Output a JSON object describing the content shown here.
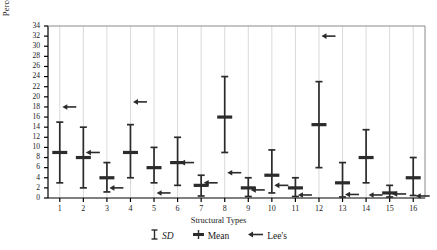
{
  "chart_data": {
    "type": "bar",
    "title": "",
    "xlabel": "Structural Types",
    "ylabel": "Percentage",
    "ylim": [
      0,
      34
    ],
    "ytick_step": 2,
    "yticks": [
      0,
      2,
      4,
      6,
      8,
      10,
      12,
      14,
      16,
      18,
      20,
      22,
      24,
      26,
      28,
      30,
      32,
      34
    ],
    "categories": [
      "1",
      "2",
      "3",
      "4",
      "5",
      "6",
      "7",
      "8",
      "9",
      "10",
      "11",
      "12",
      "13",
      "14",
      "15",
      "16"
    ],
    "grid": "vertical-only",
    "legend_position": "bottom-center",
    "series": [
      {
        "name": "Mean",
        "values": [
          9.0,
          8.0,
          4.0,
          9.0,
          6.0,
          7.0,
          2.5,
          16.0,
          2.0,
          4.5,
          2.0,
          14.5,
          3.0,
          8.0,
          1.0,
          4.0
        ]
      },
      {
        "name": "SD low",
        "values": [
          3.0,
          2.0,
          1.2,
          4.0,
          3.0,
          2.5,
          0.4,
          9.0,
          0.3,
          1.0,
          0.3,
          6.0,
          0.2,
          3.0,
          0.2,
          0.5
        ]
      },
      {
        "name": "SD high",
        "values": [
          15.0,
          14.0,
          7.0,
          14.5,
          10.0,
          12.0,
          4.5,
          24.0,
          4.0,
          9.5,
          4.0,
          23.0,
          7.0,
          13.5,
          2.5,
          8.0
        ]
      },
      {
        "name": "Lee's",
        "values": [
          18.0,
          9.0,
          2.0,
          19.0,
          1.0,
          7.0,
          3.0,
          5.0,
          1.6,
          2.5,
          0.6,
          32.0,
          0.7,
          0.6,
          0.8,
          0.4
        ]
      }
    ],
    "legend_entries": [
      {
        "key": "sd",
        "label": "SD",
        "glyph": "capped-bar",
        "italic": true
      },
      {
        "key": "mean",
        "label": "Mean",
        "glyph": "mean-marker",
        "italic": false
      },
      {
        "key": "lees",
        "label": "Lee's",
        "glyph": "left-arrow",
        "italic": false
      }
    ],
    "colors": {
      "axis": "#000000",
      "marker": "#2b2b2b",
      "gridline": "#d9d9d9",
      "background": "#ffffff"
    }
  }
}
